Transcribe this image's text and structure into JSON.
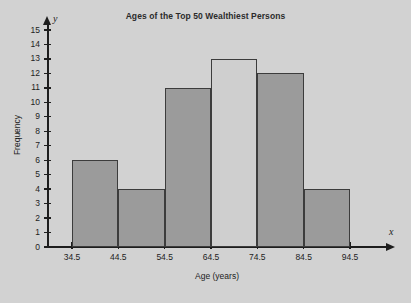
{
  "chart_data": {
    "type": "bar",
    "title": "Ages of the Top 50 Wealthiest Persons",
    "xlabel": "Age (years)",
    "ylabel": "Frequency",
    "categories": [
      "34.5-44.5",
      "44.5-54.5",
      "54.5-64.5",
      "64.5-74.5",
      "74.5-84.5",
      "84.5-94.5"
    ],
    "bin_edges": [
      34.5,
      44.5,
      54.5,
      64.5,
      74.5,
      84.5,
      94.5
    ],
    "values": [
      6,
      4,
      11,
      13,
      12,
      4
    ],
    "bar_fills": [
      "#9b9b9b",
      "#9b9b9b",
      "#9b9b9b",
      "#cfcfcf",
      "#9b9b9b",
      "#9b9b9b"
    ],
    "bar_edge_color": "#3c3c3c",
    "xlim": [
      34.5,
      94.5
    ],
    "ylim": [
      0,
      15
    ],
    "x_tick_labels": [
      "34.5",
      "44.5",
      "54.5",
      "64.5",
      "74.5",
      "84.5",
      "94.5"
    ],
    "y_tick_labels": [
      "0",
      "1",
      "2",
      "3",
      "4",
      "5",
      "6",
      "7",
      "8",
      "9",
      "10",
      "11",
      "12",
      "13",
      "14",
      "15"
    ],
    "y_ticks": [
      0,
      1,
      2,
      3,
      4,
      5,
      6,
      7,
      8,
      9,
      10,
      11,
      12,
      13,
      14,
      15
    ],
    "grid": false,
    "legend": null,
    "x_axis_variable": "x",
    "y_axis_variable": "y",
    "background_color": "#d2d2d2",
    "axis_color": "#1d1d1d"
  }
}
